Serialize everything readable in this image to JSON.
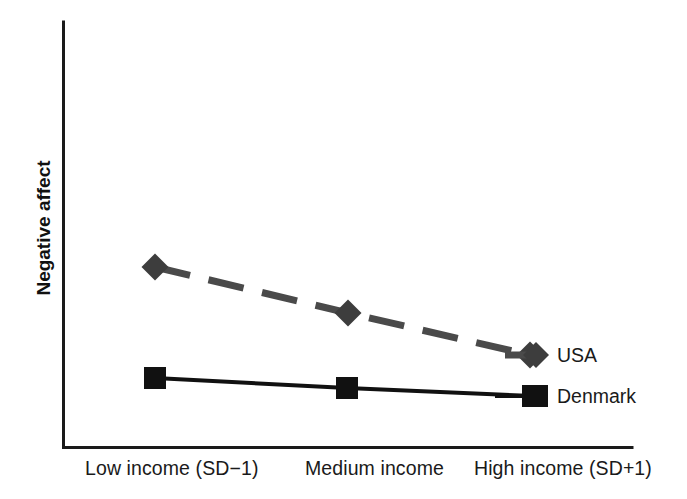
{
  "figure": {
    "background_color": "#ffffff",
    "width": 687,
    "height": 499
  },
  "axes": {
    "y_label": "Negative affect",
    "x_tick_labels": [
      "Low income (SD−1)",
      "Medium income",
      "High income (SD+1)"
    ],
    "axis_color": "#1a1a1a"
  },
  "legend": {
    "entries": [
      {
        "label": "USA",
        "color": "#4a4a4a",
        "marker": "diamond",
        "line": "dashed"
      },
      {
        "label": "Denmark",
        "color": "#111111",
        "marker": "square",
        "line": "solid"
      }
    ]
  },
  "chart_data": {
    "type": "line",
    "title": "",
    "xlabel": "",
    "ylabel": "Negative affect",
    "categories": [
      "Low income (SD−1)",
      "Medium income",
      "High income (SD+1)"
    ],
    "series": [
      {
        "name": "USA",
        "values": [
          0.78,
          0.57,
          0.37
        ],
        "color": "#4a4a4a",
        "linestyle": "dashed",
        "marker": "diamond",
        "pixel_points": [
          [
            155,
            267
          ],
          [
            348,
            313
          ],
          [
            530,
            355
          ]
        ]
      },
      {
        "name": "Denmark",
        "values": [
          0.27,
          0.22,
          0.19
        ],
        "color": "#111111",
        "linestyle": "solid",
        "marker": "square",
        "pixel_points": [
          [
            155,
            378
          ],
          [
            347,
            388
          ],
          [
            533,
            396
          ]
        ]
      }
    ],
    "ylim": [
      0,
      1
    ],
    "y_ticks": [],
    "grid": false,
    "legend_position": "right-inside"
  }
}
